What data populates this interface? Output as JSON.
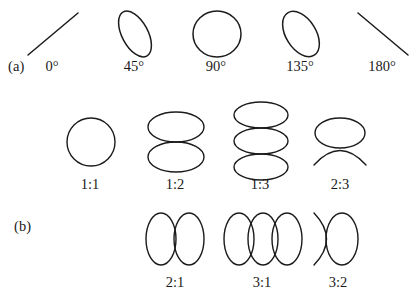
{
  "figure": {
    "title_fragment_top_left": "",
    "title_fragment_top_mid": "",
    "rows": [
      {
        "id": "row-a",
        "row_label": "(a)",
        "caption_note": "phase difference for 1:1 frequency ratio",
        "items": [
          {
            "label": "0°",
            "shape": "line-up-right",
            "cx": 52,
            "cy": 35
          },
          {
            "label": "45°",
            "shape": "ellipse-tilt-45",
            "cx": 134,
            "cy": 35
          },
          {
            "label": "90°",
            "shape": "circle",
            "cx": 216,
            "cy": 35
          },
          {
            "label": "135°",
            "shape": "ellipse-tilt-135",
            "cx": 300,
            "cy": 35
          },
          {
            "label": "180°",
            "shape": "line-down-right",
            "cx": 382,
            "cy": 35
          }
        ]
      },
      {
        "id": "row-b-top",
        "row_label": "",
        "caption_note": "frequency ratios, vertical stacking",
        "items": [
          {
            "label": "1:1",
            "shape": "circle",
            "cx": 90,
            "cy": 142
          },
          {
            "label": "1:2",
            "shape": "two-stacked-ellipses",
            "cx": 175,
            "cy": 142
          },
          {
            "label": "1:3",
            "shape": "three-stacked-ellipses",
            "cx": 260,
            "cy": 142
          },
          {
            "label": "2:3",
            "shape": "ellipse-with-lower-arc",
            "cx": 340,
            "cy": 142
          }
        ]
      },
      {
        "id": "row-b-bottom",
        "row_label": "(b)",
        "caption_note": "frequency ratios, horizontal arrangement",
        "items": [
          {
            "label": "2:1",
            "shape": "two-side-ellipses",
            "cx": 175,
            "cy": 243
          },
          {
            "label": "3:1",
            "shape": "three-side-ellipses",
            "cx": 262,
            "cy": 243
          },
          {
            "label": "3:2",
            "shape": "arc-with-ellipse",
            "cx": 338,
            "cy": 243
          }
        ]
      }
    ]
  }
}
